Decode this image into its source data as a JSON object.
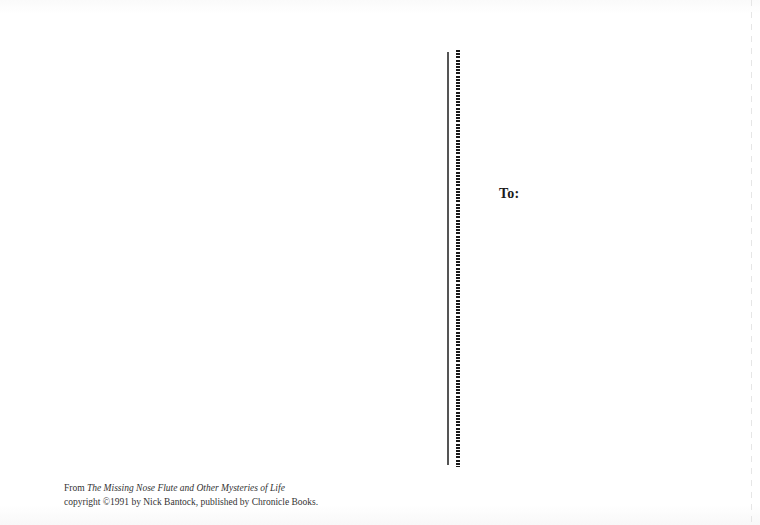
{
  "postcard": {
    "address_label": "To:",
    "credits": {
      "line1_prefix": "From ",
      "book_title": "The Missing Nose Flute and Other Mysteries of Life",
      "line2": "copyright ©1991 by Nick Bantock, published by Chronicle Books."
    },
    "divider": {
      "solid_color": "#555555",
      "dotted_color": "#1a1a1a"
    }
  }
}
